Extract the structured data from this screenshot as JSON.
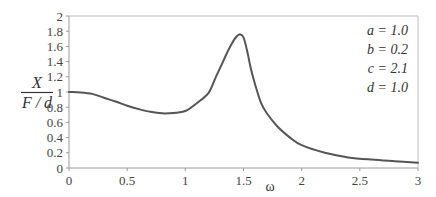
{
  "chart_data": {
    "type": "line",
    "title": "",
    "xlabel": "ω",
    "ylabel": {
      "numerator": "X",
      "denominator": "F / d"
    },
    "xlim": [
      0,
      3
    ],
    "ylim": [
      0,
      2
    ],
    "grid": false,
    "x_ticks": [
      "0",
      "0.5",
      "1",
      "1.5",
      "2",
      "2.5",
      "3"
    ],
    "y_ticks": [
      "0",
      "0.2",
      "0.4",
      "0.6",
      "0.8",
      "1",
      "1.2",
      "1.4",
      "1.6",
      "1.8",
      "2"
    ],
    "annotations": [
      "a = 1.0",
      "b = 0.2",
      "c = 2.1",
      "d = 1.0"
    ],
    "series": [
      {
        "name": "X/(F/d)",
        "color": "#555555",
        "x": [
          0,
          0.1,
          0.2,
          0.3,
          0.4,
          0.5,
          0.6,
          0.7,
          0.8,
          0.9,
          1.0,
          1.1,
          1.2,
          1.26,
          1.3,
          1.36,
          1.4,
          1.44,
          1.47,
          1.5,
          1.53,
          1.56,
          1.6,
          1.65,
          1.7,
          1.79,
          1.9,
          2.0,
          2.2,
          2.4,
          2.6,
          2.8,
          3.0
        ],
        "values": [
          1.0,
          0.995,
          0.975,
          0.925,
          0.875,
          0.82,
          0.775,
          0.74,
          0.72,
          0.725,
          0.75,
          0.855,
          0.99,
          1.19,
          1.32,
          1.52,
          1.64,
          1.73,
          1.76,
          1.72,
          1.55,
          1.33,
          1.1,
          0.86,
          0.72,
          0.55,
          0.4,
          0.3,
          0.2,
          0.14,
          0.11,
          0.09,
          0.07
        ]
      }
    ]
  }
}
